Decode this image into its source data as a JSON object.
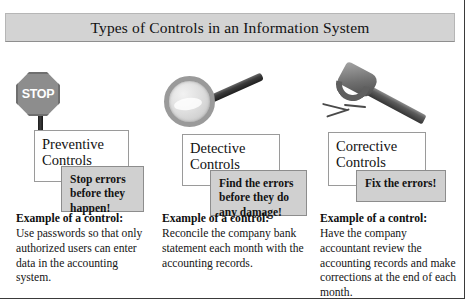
{
  "header": {
    "title": "Types of Controls in an Information System"
  },
  "colors": {
    "header_bg": "#d3d3d3",
    "detail_box_bg": "#d0d0d0",
    "box_border": "#9a9a9a",
    "icon_gray": "#8d8d8d",
    "text": "#111111"
  },
  "example_label": "Example of a control:",
  "columns": [
    {
      "icon": "stop-sign-icon",
      "icon_text": "STOP",
      "title": "Preventive\nControls",
      "title_line1": "Preventive",
      "title_line2": "Controls",
      "detail": "Stop errors before they happen!",
      "detail_line1": "Stop errors",
      "detail_line2": "before they",
      "detail_line3": "happen!",
      "example_label": "Example of a control:",
      "example_body": "Use passwords so that only authorized users can enter data in the accounting system."
    },
    {
      "icon": "magnifying-glass-icon",
      "icon_text": "",
      "title": "Detective\nControls",
      "title_line1": "Detective",
      "title_line2": "Controls",
      "detail": "Find the errors before they do any damage!",
      "detail_line1": "Find the errors",
      "detail_line2": "before they do",
      "detail_line3": "any damage!",
      "example_label": "Example of a control:",
      "example_body": "Reconcile the company bank statement each month with the accounting records."
    },
    {
      "icon": "hammer-icon",
      "icon_text": "",
      "title": "Corrective\nControls",
      "title_line1": "Corrective",
      "title_line2": "Controls",
      "detail": "Fix the errors!",
      "detail_line1": "Fix the errors!",
      "detail_line2": "",
      "detail_line3": "",
      "example_label": "Example of a control:",
      "example_body": "Have the company accountant review the accounting records and make corrections at the end of each month."
    }
  ]
}
